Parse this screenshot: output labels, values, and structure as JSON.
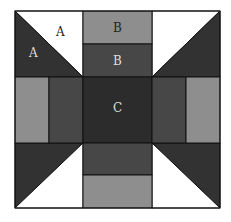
{
  "diagram": {
    "colors": {
      "white": "#ffffff",
      "light": "#8e8e8e",
      "mid": "#474747",
      "dark": "#323232",
      "center": "#2c2c2c",
      "outline": "#111111"
    },
    "labels": {
      "corner_white": "A",
      "corner_dark": "A",
      "top_light": "B",
      "top_mid": "B",
      "center": "C"
    }
  }
}
